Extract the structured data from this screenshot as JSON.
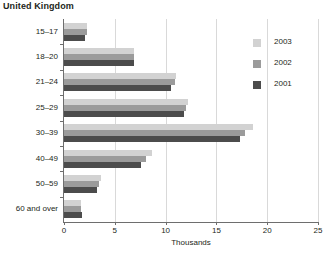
{
  "chart_data": {
    "type": "bar",
    "orientation": "horizontal",
    "title": "United Kingdom",
    "xlabel": "Thousands",
    "ylabel": "",
    "xlim": [
      0,
      25
    ],
    "xticks": [
      0,
      5,
      10,
      15,
      20,
      25
    ],
    "xtick_labels": [
      "0",
      "5",
      "10",
      "15",
      "20",
      "25"
    ],
    "grid": true,
    "grid_axis": "x",
    "legend_position": "right",
    "categories": [
      "15–17",
      "18–20",
      "21–24",
      "25–29",
      "30–39",
      "40–49",
      "50–59",
      "60 and over"
    ],
    "series": [
      {
        "name": "2003",
        "color": "#d2d2d2",
        "values": [
          2.3,
          6.9,
          11.0,
          12.2,
          18.6,
          8.7,
          3.6,
          1.7
        ]
      },
      {
        "name": "2002",
        "color": "#9b9b9b",
        "values": [
          2.3,
          6.9,
          10.9,
          12.0,
          17.8,
          8.1,
          3.4,
          1.7
        ]
      },
      {
        "name": "2001",
        "color": "#4c4c4c",
        "values": [
          2.1,
          6.9,
          10.5,
          11.8,
          17.3,
          7.6,
          3.2,
          1.8
        ]
      }
    ]
  },
  "legend": {
    "entries": [
      {
        "label": "2003",
        "swatch_class": "y2003"
      },
      {
        "label": "2002",
        "swatch_class": "y2002"
      },
      {
        "label": "2001",
        "swatch_class": "y2001"
      }
    ]
  },
  "colors": {
    "year_2003": "#d2d2d2",
    "year_2002": "#9b9b9b",
    "year_2001": "#4c4c4c",
    "axis": "#6e6e6e",
    "gridline": "#d9d9d9",
    "text": "#231f20",
    "background": "#ffffff"
  }
}
